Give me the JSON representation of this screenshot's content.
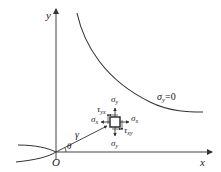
{
  "axes": {
    "x_label": "x",
    "y_label": "y",
    "origin_label": "O"
  },
  "curve": {
    "label_main": "σ",
    "label_sub": "y",
    "label_eq": "=0"
  },
  "element": {
    "sigma_y_top": "σ",
    "sigma_y_top_sub": "y",
    "sigma_y_bottom": "σ",
    "sigma_y_bottom_sub": "y",
    "sigma_x_left": "σ",
    "sigma_x_left_sub": "x",
    "sigma_x_right": "σ",
    "sigma_x_right_sub": "x",
    "tau_yx": "τ",
    "tau_yx_sub": "yx",
    "tau_xy": "τ",
    "tau_xy_sub": "xy"
  },
  "polar": {
    "radius_label": "γ",
    "angle_label": "θ"
  },
  "colors": {
    "stroke": "#333333",
    "background": "#ffffff"
  }
}
